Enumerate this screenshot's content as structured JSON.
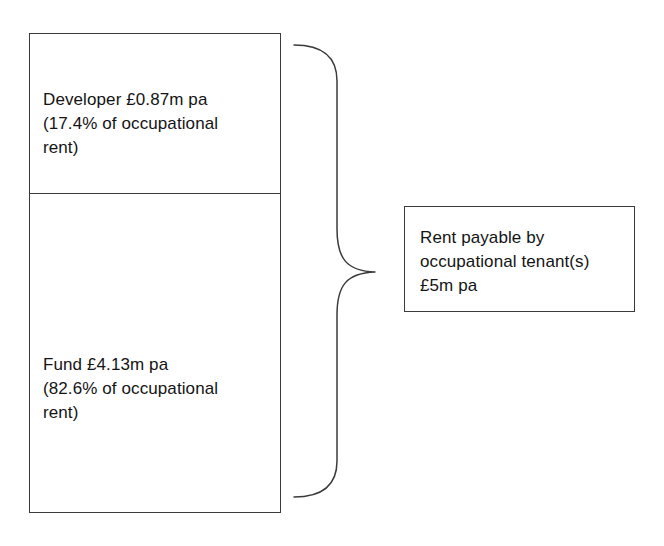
{
  "diagram": {
    "line_color": "#3b3b3b",
    "text_color": "#141414",
    "background": "#ffffff",
    "rent_column": {
      "name": "occupational-rent-split",
      "segments": [
        {
          "id": "developer",
          "label": "Developer £0.87m pa\n(17.4% of occupational\nrent)",
          "party": "Developer",
          "amount": "£0.87m pa",
          "share": "17.4% of occupational rent",
          "share_percent": 17.4
        },
        {
          "id": "fund",
          "label": "Fund £4.13m pa\n(82.6% of occupational\nrent)",
          "party": "Fund",
          "amount": "£4.13m pa",
          "share": "82.6% of occupational rent",
          "share_percent": 82.6
        }
      ]
    },
    "brace": {
      "name": "grouping-brace",
      "orientation": "right-pointing",
      "icon": "curly-brace-icon"
    },
    "summary_box": {
      "id": "occupational-rent-total",
      "label": "Rent payable by\noccupational tenant(s)\n£5m pa",
      "description": "Rent payable by occupational tenant(s)",
      "amount": "£5m pa"
    }
  }
}
